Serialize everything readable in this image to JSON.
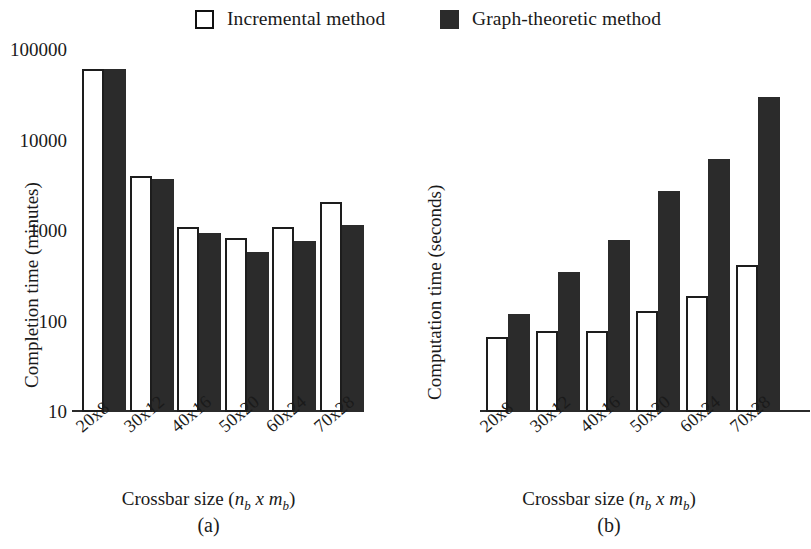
{
  "legend": {
    "items": [
      {
        "label": "Incremental method",
        "swatch": "open-square-icon",
        "color": "#ffffff"
      },
      {
        "label": "Graph-theoretic method",
        "swatch": "filled-square-icon",
        "color": "#2b2b2b"
      }
    ]
  },
  "panel_a": {
    "caption": "(a)",
    "ylabel": "Completion time (minutes)",
    "xlabel_pre": "Crossbar size (",
    "xlabel_n": "n",
    "xlabel_sub1": "b",
    "xlabel_x": " x ",
    "xlabel_m": "m",
    "xlabel_sub2": "b",
    "xlabel_post": ")",
    "yticks": [
      "0",
      "5",
      "10",
      "15",
      "20",
      "25",
      "30",
      "35",
      "40"
    ],
    "xticks": [
      "20x8",
      "30x12",
      "40x16",
      "50x20",
      "60x24",
      "70x28"
    ]
  },
  "panel_b": {
    "caption": "(b)",
    "ylabel": "Computation time (seconds)",
    "xlabel_pre": "Crossbar size (",
    "xlabel_n": "n",
    "xlabel_sub1": "b",
    "xlabel_x": " x ",
    "xlabel_m": "m",
    "xlabel_sub2": "b",
    "xlabel_post": ")",
    "yticks": [
      "10",
      "100",
      "1000",
      "10000",
      "100000"
    ],
    "xticks": [
      "20x8",
      "30x12",
      "40x16",
      "50x20",
      "60x24",
      "70x28"
    ]
  },
  "chart_data": [
    {
      "type": "bar",
      "panel": "(a)",
      "title": "",
      "xlabel": "Crossbar size (n_b x m_b)",
      "ylabel": "Completion time (minutes)",
      "categories": [
        "20x8",
        "30x12",
        "40x16",
        "50x20",
        "60x24",
        "70x28"
      ],
      "series": [
        {
          "name": "Incremental method",
          "color": "#ffffff",
          "values": [
            37.6,
            25.9,
            20.3,
            19.1,
            20.3,
            23.0
          ]
        },
        {
          "name": "Graph-theoretic method",
          "color": "#2b2b2b",
          "values": [
            37.6,
            25.5,
            19.6,
            17.5,
            18.7,
            20.5
          ]
        }
      ],
      "ylim": [
        0,
        40
      ],
      "yticks": [
        0,
        5,
        10,
        15,
        20,
        25,
        30,
        35,
        40
      ],
      "yscale": "linear",
      "grid": false,
      "legend_position": "top"
    },
    {
      "type": "bar",
      "panel": "(b)",
      "title": "",
      "xlabel": "Crossbar size (n_b x m_b)",
      "ylabel": "Computation time (seconds)",
      "categories": [
        "20x8",
        "30x12",
        "40x16",
        "50x20",
        "60x24",
        "70x28"
      ],
      "series": [
        {
          "name": "Incremental method",
          "color": "#ffffff",
          "values": [
            68,
            78,
            78,
            130,
            190,
            420
          ]
        },
        {
          "name": "Graph-theoretic method",
          "color": "#2b2b2b",
          "values": [
            120,
            350,
            800,
            2800,
            6200,
            30000
          ]
        }
      ],
      "ylim": [
        10,
        100000
      ],
      "yticks": [
        10,
        100,
        1000,
        10000,
        100000
      ],
      "yscale": "log",
      "grid": false,
      "legend_position": "top"
    }
  ]
}
